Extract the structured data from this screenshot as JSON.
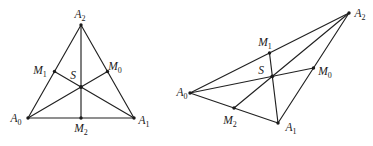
{
  "canvas": {
    "width": 373,
    "height": 146,
    "background": "#ffffff",
    "stroke_color": "#212121",
    "stroke_width": 1.15,
    "dot_color": "#1a1a1a",
    "dot_radius": 1.7,
    "centroid_dot_radius": 1.9,
    "label_color": "#1a1a1a",
    "label_font_size": 11.5,
    "sub_font_size": 8
  },
  "figures": [
    {
      "name": "acute-triangle-medians",
      "description": "Triangle A0 A1 A2 with side midpoints M0 M1 M2 and medians intersecting at centroid S",
      "points": {
        "A0": [
          28,
          118
        ],
        "A1": [
          134,
          118
        ],
        "A2": [
          81,
          25
        ],
        "M0": [
          107.5,
          71.5
        ],
        "M1": [
          54.5,
          71.5
        ],
        "M2": [
          81,
          118
        ],
        "S": [
          81,
          87
        ]
      },
      "edges": [
        [
          "A0",
          "A1"
        ],
        [
          "A1",
          "A2"
        ],
        [
          "A2",
          "A0"
        ]
      ],
      "medians": [
        [
          "A0",
          "M0"
        ],
        [
          "A1",
          "M1"
        ],
        [
          "A2",
          "M2"
        ]
      ],
      "dots": [
        "A0",
        "A1",
        "A2",
        "M0",
        "M1",
        "M2",
        "S"
      ],
      "labels": [
        {
          "point": "A2",
          "base": "A",
          "sub": "2",
          "x": 80,
          "y": 18
        },
        {
          "point": "M1",
          "base": "M",
          "sub": "1",
          "x": 40,
          "y": 74
        },
        {
          "point": "S",
          "base": "S",
          "sub": "",
          "x": 73,
          "y": 79
        },
        {
          "point": "M0",
          "base": "M",
          "sub": "0",
          "x": 115,
          "y": 70
        },
        {
          "point": "A0",
          "base": "A",
          "sub": "0",
          "x": 16,
          "y": 122
        },
        {
          "point": "M2",
          "base": "M",
          "sub": "2",
          "x": 81,
          "y": 132
        },
        {
          "point": "A1",
          "base": "A",
          "sub": "1",
          "x": 144,
          "y": 124
        }
      ]
    },
    {
      "name": "obtuse-triangle-medians",
      "description": "Skewed triangle A0 A1 A2 with side midpoints M0 M1 M2 and medians intersecting at centroid S",
      "points": {
        "A0": [
          190,
          93
        ],
        "A1": [
          278,
          123
        ],
        "A2": [
          349,
          13
        ],
        "M0": [
          313.5,
          68
        ],
        "M1": [
          269.5,
          53
        ],
        "M2": [
          234,
          108
        ],
        "S": [
          272.3,
          76.3
        ]
      },
      "edges": [
        [
          "A0",
          "A1"
        ],
        [
          "A1",
          "A2"
        ],
        [
          "A2",
          "A0"
        ]
      ],
      "medians": [
        [
          "A0",
          "M0"
        ],
        [
          "A1",
          "M1"
        ],
        [
          "A2",
          "M2"
        ]
      ],
      "dots": [
        "A0",
        "A1",
        "A2",
        "M0",
        "M1",
        "M2",
        "S"
      ],
      "labels": [
        {
          "point": "A2",
          "base": "A",
          "sub": "2",
          "x": 360,
          "y": 17
        },
        {
          "point": "M1",
          "base": "M",
          "sub": "1",
          "x": 265,
          "y": 46
        },
        {
          "point": "S",
          "base": "S",
          "sub": "",
          "x": 261,
          "y": 74
        },
        {
          "point": "M0",
          "base": "M",
          "sub": "0",
          "x": 325,
          "y": 75
        },
        {
          "point": "A0",
          "base": "A",
          "sub": "0",
          "x": 182,
          "y": 96
        },
        {
          "point": "M2",
          "base": "M",
          "sub": "2",
          "x": 230,
          "y": 124
        },
        {
          "point": "A1",
          "base": "A",
          "sub": "1",
          "x": 291,
          "y": 131
        }
      ]
    }
  ]
}
